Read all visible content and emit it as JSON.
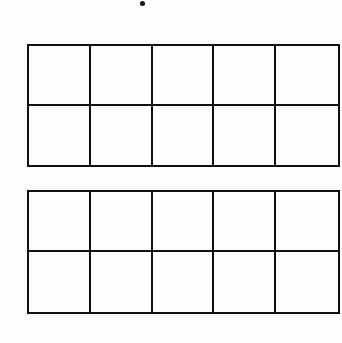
{
  "worksheet": {
    "marker": "dot",
    "ten_frames": [
      {
        "id": "top",
        "rows": 2,
        "columns": 5,
        "cells": [
          [
            "",
            "",
            "",
            "",
            ""
          ],
          [
            "",
            "",
            "",
            "",
            ""
          ]
        ]
      },
      {
        "id": "bottom",
        "rows": 2,
        "columns": 5,
        "cells": [
          [
            "",
            "",
            "",
            "",
            ""
          ],
          [
            "",
            "",
            "",
            "",
            ""
          ]
        ]
      }
    ]
  },
  "colors": {
    "line": "#111111",
    "background": "#ffffff"
  }
}
